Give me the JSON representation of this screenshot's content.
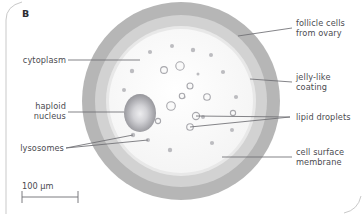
{
  "figure": {
    "panel_letter": "B"
  },
  "labels": {
    "cytoplasm": "cytoplasm",
    "haploid_nucleus": "haploid\nnucleus",
    "lysosomes": "lysosomes",
    "follicle_cells": "follicle cells\nfrom ovary",
    "jelly_coating": "jelly-like\ncoating",
    "lipid_droplets": "lipid droplets",
    "cell_surface_membrane": "cell surface\nmembrane"
  },
  "scale_bar": {
    "text": "100 µm",
    "value": 100,
    "unit": "µm"
  },
  "colors": {
    "follicle_ring": "#b6b6b6",
    "jelly_ring": "#d3d3d3",
    "membrane_ring": "#e9e9e9",
    "cytoplasm": "#fbfbfb",
    "nucleus_edge": "#8f8f93",
    "nucleus_center": "#e4e4e6",
    "organelle": "#b9b9bd",
    "leader_line": "#6e6e73",
    "text": "#4b4b50",
    "page_border": "#c9c9c9"
  },
  "organelles": {
    "lysosomes": [
      {
        "cx": 150,
        "cy": 52,
        "r": 2.1
      },
      {
        "cx": 172,
        "cy": 46,
        "r": 2.0
      },
      {
        "cx": 193,
        "cy": 50,
        "r": 2.2
      },
      {
        "cx": 211,
        "cy": 55,
        "r": 2.0
      },
      {
        "cx": 132,
        "cy": 71,
        "r": 2.2
      },
      {
        "cx": 223,
        "cy": 72,
        "r": 2.1
      },
      {
        "cx": 124,
        "cy": 90,
        "r": 2.0
      },
      {
        "cx": 236,
        "cy": 97,
        "r": 2.1
      },
      {
        "cx": 232,
        "cy": 130,
        "r": 2.0
      },
      {
        "cx": 212,
        "cy": 143,
        "r": 2.1
      },
      {
        "cx": 170,
        "cy": 150,
        "r": 2.2
      },
      {
        "cx": 148,
        "cy": 140,
        "r": 2.0
      },
      {
        "cx": 133,
        "cy": 135,
        "r": 2.2
      },
      {
        "cx": 203,
        "cy": 117,
        "r": 2.0
      },
      {
        "cx": 184,
        "cy": 97,
        "r": 1.6
      },
      {
        "cx": 198,
        "cy": 74,
        "r": 1.5
      }
    ],
    "lipid_droplets": [
      {
        "cx": 164,
        "cy": 70,
        "r": 3.4
      },
      {
        "cx": 180,
        "cy": 66,
        "r": 4.2
      },
      {
        "cx": 190,
        "cy": 86,
        "r": 3.0
      },
      {
        "cx": 171,
        "cy": 106,
        "r": 4.3
      },
      {
        "cx": 182,
        "cy": 96,
        "r": 2.7
      },
      {
        "cx": 207,
        "cy": 97,
        "r": 3.3
      },
      {
        "cx": 196,
        "cy": 116,
        "r": 3.6
      },
      {
        "cx": 190,
        "cy": 127,
        "r": 3.3
      },
      {
        "cx": 233,
        "cy": 113,
        "r": 2.6
      },
      {
        "cx": 158,
        "cy": 121,
        "r": 2.6
      }
    ],
    "nucleus": {
      "cx": 140,
      "cy": 113,
      "rx": 16,
      "ry": 19
    }
  }
}
